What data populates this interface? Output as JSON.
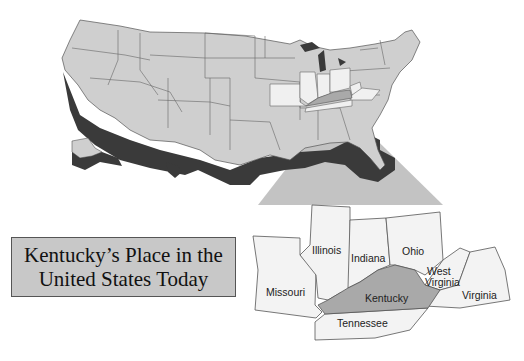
{
  "title": {
    "line1": "Kentucky’s Place in the",
    "line2": "United States Today"
  },
  "inset": {
    "states": [
      {
        "name": "Illinois",
        "label": "Illinois"
      },
      {
        "name": "Indiana",
        "label": "Indiana"
      },
      {
        "name": "Ohio",
        "label": "Ohio"
      },
      {
        "name": "West Virginia",
        "label_line1": "West",
        "label_line2": "Virginia"
      },
      {
        "name": "Missouri",
        "label": "Missouri"
      },
      {
        "name": "Kentucky",
        "label": "Kentucky",
        "highlighted": true
      },
      {
        "name": "Virginia",
        "label": "Virginia"
      },
      {
        "name": "Tennessee",
        "label": "Tennessee"
      }
    ]
  },
  "colors": {
    "land": "#cfcfcf",
    "neighbor_states": "#f0f0f0",
    "kentucky": "#a9a9a9",
    "shadow": "#3a3a3a",
    "projection_cone": "#bdbdbd",
    "title_box": "#c8c8c8"
  }
}
